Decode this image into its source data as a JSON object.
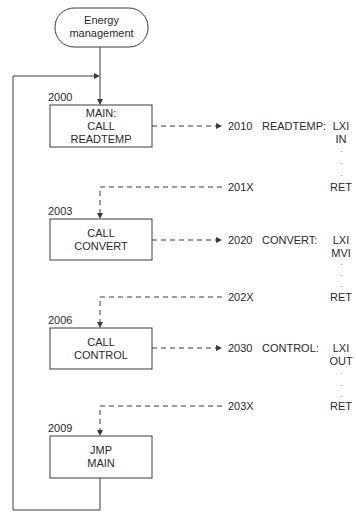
{
  "diagram": {
    "start": {
      "label_line1": "Energy",
      "label_line2": "management"
    },
    "main_blocks": [
      {
        "address": "2000",
        "line1": "MAIN:",
        "line2": "CALL",
        "line3": "READTEMP"
      },
      {
        "address": "2003",
        "line1": "CALL",
        "line2": "CONVERT"
      },
      {
        "address": "2006",
        "line1": "CALL",
        "line2": "CONTROL"
      },
      {
        "address": "2009",
        "line1": "JMP",
        "line2": "MAIN"
      }
    ],
    "subroutines": [
      {
        "address": "2010",
        "name": "READTEMP:",
        "instr1": "LXI",
        "instr2": "IN",
        "dots": ".",
        "return_addr": "201X",
        "ret": "RET"
      },
      {
        "address": "2020",
        "name": "CONVERT:",
        "instr1": "LXI",
        "instr2": "MVI",
        "dots": ".",
        "return_addr": "202X",
        "ret": "RET"
      },
      {
        "address": "2030",
        "name": "CONTROL:",
        "instr1": "LXI",
        "instr2": "OUT",
        "dots": ".",
        "return_addr": "203X",
        "ret": "RET"
      }
    ],
    "colors": {
      "line": "#3a3a3a",
      "text": "#2a2a2a",
      "background": "#ffffff"
    }
  }
}
